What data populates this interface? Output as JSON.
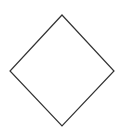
{
  "canvas": {
    "width": 124,
    "height": 132,
    "background": "#ffffff"
  },
  "shapes": [
    {
      "type": "diamond",
      "role": "decision-node",
      "label": "",
      "points": [
        [
          62,
          15
        ],
        [
          114,
          71
        ],
        [
          62,
          126
        ],
        [
          10,
          71
        ]
      ],
      "stroke": "#333333",
      "stroke_width": 1.2,
      "fill": "#ffffff"
    }
  ]
}
